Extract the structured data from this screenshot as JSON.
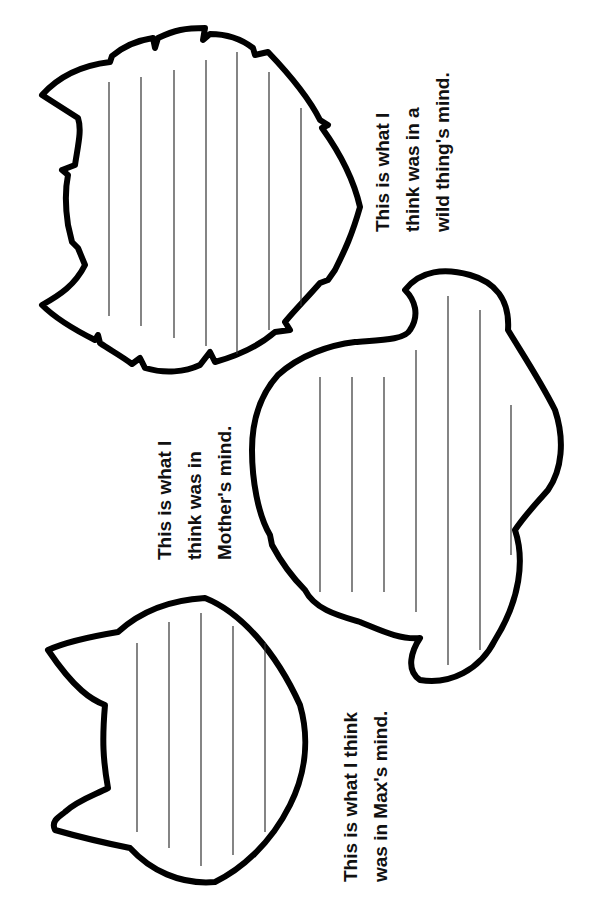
{
  "worksheet": {
    "captions": {
      "wild_thing": [
        "This is what I",
        "think was in a",
        "wild thing's mind."
      ],
      "mother": [
        "This is what I",
        "think was in",
        "Mother's mind."
      ],
      "max": [
        "This is what I think",
        "was in Max's mind."
      ]
    },
    "shapes": [
      {
        "name": "wild-thing-head",
        "ruled_lines": 7
      },
      {
        "name": "mother-cloud",
        "ruled_lines": 7
      },
      {
        "name": "max-head",
        "ruled_lines": 5
      }
    ]
  }
}
